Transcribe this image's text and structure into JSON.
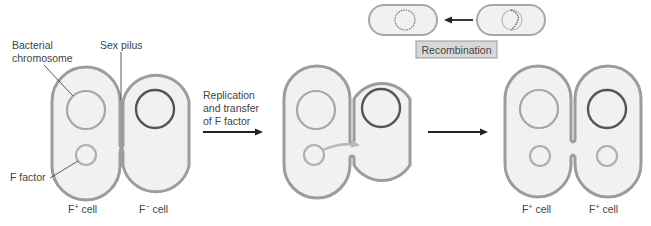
{
  "colors": {
    "cell_outline": "#9c9c9c",
    "cell_fill": "#f1f1f1",
    "host_chromosome": "#a6a6a6",
    "recipient_chromosome": "#555555",
    "f_factor": "#b0b0b0",
    "arrow": "#222222",
    "label_text": "#444444",
    "recombination_box_fill": "#d8d8d8"
  },
  "labels": {
    "bacterial_chromosome_line1": "Bacterial",
    "bacterial_chromosome_line2": "chromosome",
    "sex_pilus": "Sex pilus",
    "f_factor": "F factor",
    "step1_line1": "Replication",
    "step1_line2": "and transfer",
    "step1_line3": "of F factor",
    "recombination": "Recombination"
  },
  "stages": [
    {
      "left_cell": {
        "base": "F",
        "sup": "+",
        "suffix": " cell"
      },
      "right_cell": {
        "base": "F",
        "sup": "−",
        "suffix": " cell"
      }
    },
    {
      "left_cell": null,
      "right_cell": null
    },
    {
      "left_cell": {
        "base": "F",
        "sup": "+",
        "suffix": " cell"
      },
      "right_cell": {
        "base": "F",
        "sup": "+",
        "suffix": " cell"
      }
    }
  ]
}
